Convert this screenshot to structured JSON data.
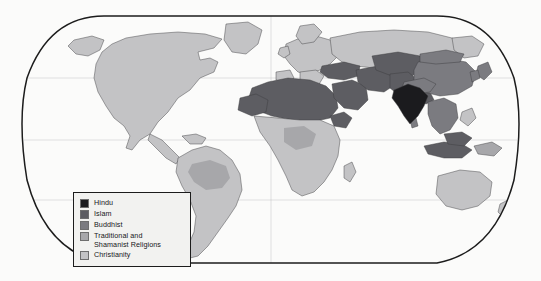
{
  "figure": {
    "type": "thematic-world-map",
    "projection": "robinson",
    "background_color": "#fbfbfa",
    "outline_color": "#1c1c1c",
    "graticule_color": "#8d8d8d"
  },
  "legend": {
    "title": "",
    "box_fill": "#f2f2f0",
    "box_border": "#1c1c1c",
    "items": [
      {
        "label": "Hindu",
        "color": "#1b1b1e"
      },
      {
        "label": "Islam",
        "color": "#5d5d62"
      },
      {
        "label": "Buddhist",
        "color": "#7b7b80"
      },
      {
        "label": "Traditional and\nShamanist Religions",
        "color": "#a7a7aa"
      },
      {
        "label": "Christianity",
        "color": "#c3c3c5"
      }
    ]
  },
  "map_regions": {
    "hindu": [
      "India",
      "Nepal"
    ],
    "islam": [
      "Morocco",
      "Algeria",
      "Tunisia",
      "Libya",
      "Egypt",
      "Sudan",
      "Mauritania",
      "Mali",
      "Niger",
      "Chad",
      "Somalia",
      "Senegal",
      "Guinea",
      "Saudi Arabia",
      "Yemen",
      "Oman",
      "Iraq",
      "Iran",
      "Syria",
      "Jordan",
      "Turkey",
      "Afghanistan",
      "Pakistan",
      "Bangladesh",
      "Turkmenistan",
      "Uzbekistan",
      "Kazakhstan",
      "Kyrgyzstan",
      "Tajikistan",
      "Azerbaijan",
      "Indonesia",
      "Malaysia",
      "Brunei"
    ],
    "buddhist": [
      "China",
      "Mongolia",
      "Japan",
      "Korea",
      "Myanmar",
      "Thailand",
      "Laos",
      "Cambodia",
      "Vietnam",
      "Bhutan",
      "Sri Lanka",
      "Tibet"
    ],
    "traditional_shamanist": [
      "Amazon Basin",
      "Central Africa interior",
      "Papua New Guinea",
      "Siberia north"
    ],
    "christianity": [
      "Canada",
      "United States",
      "Mexico",
      "Central America",
      "Caribbean",
      "Brazil",
      "Argentina",
      "Chile",
      "Peru",
      "Colombia",
      "Venezuela",
      "Bolivia",
      "Paraguay",
      "Uruguay",
      "Ecuador",
      "Guyana",
      "Greenland",
      "Iceland",
      "United Kingdom",
      "Ireland",
      "France",
      "Spain",
      "Portugal",
      "Germany",
      "Poland",
      "Italy",
      "Greece",
      "Scandinavia",
      "Russia",
      "Ukraine",
      "Belarus",
      "Romania",
      "Bulgaria",
      "Nigeria south",
      "Ghana",
      "Cameroon",
      "DR Congo",
      "Kenya",
      "Uganda",
      "Tanzania",
      "Zambia",
      "Angola",
      "Mozambique",
      "Zimbabwe",
      "South Africa",
      "Madagascar",
      "Ethiopia",
      "Australia",
      "New Zealand",
      "Philippines"
    ]
  },
  "colors": {
    "hindu": "#1b1b1e",
    "islam": "#5d5d62",
    "buddhist": "#7b7b80",
    "traditional": "#a7a7aa",
    "christianity": "#c3c3c5",
    "unclassified": "#d9d9da",
    "border": "#3c3c3e",
    "ocean": "#fbfbfa"
  }
}
